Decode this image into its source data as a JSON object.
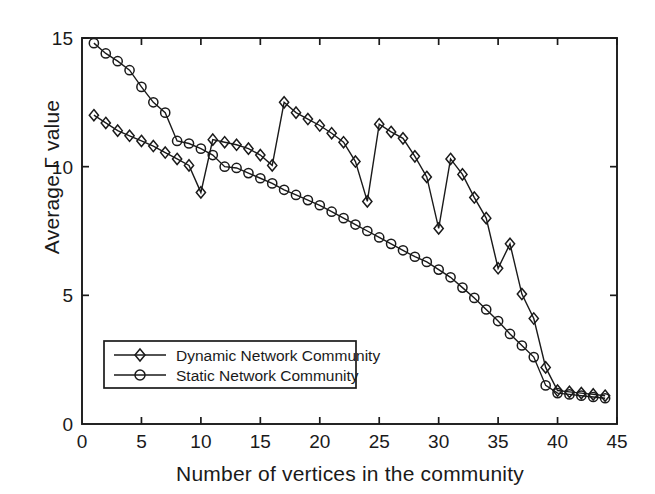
{
  "chart_data": {
    "type": "line",
    "title": "",
    "xlabel": "Number of vertices in the community",
    "ylabel": "Average Γ value",
    "xlim": [
      0,
      45
    ],
    "ylim": [
      0,
      15
    ],
    "xticks": [
      0,
      5,
      10,
      15,
      20,
      25,
      30,
      35,
      40,
      45
    ],
    "yticks": [
      0,
      5,
      10,
      15
    ],
    "xticklabels": [
      "0",
      "5",
      "10",
      "15",
      "20",
      "25",
      "30",
      "35",
      "40",
      "45"
    ],
    "yticklabels": [
      "0",
      "5",
      "10",
      "15"
    ],
    "grid": false,
    "legend_position": "lower left",
    "x": [
      1,
      2,
      3,
      4,
      5,
      6,
      7,
      8,
      9,
      10,
      11,
      12,
      13,
      14,
      15,
      16,
      17,
      18,
      19,
      20,
      21,
      22,
      23,
      24,
      25,
      26,
      27,
      28,
      29,
      30,
      31,
      32,
      33,
      34,
      35,
      36,
      37,
      38,
      39,
      40,
      41,
      42,
      43,
      44
    ],
    "series": [
      {
        "name": "Dynamic Network Community",
        "marker": "diamond",
        "color": "#1a1a1a",
        "values": [
          12.0,
          11.7,
          11.4,
          11.2,
          11.0,
          10.8,
          10.55,
          10.3,
          10.05,
          9.0,
          11.05,
          10.95,
          10.85,
          10.7,
          10.45,
          10.05,
          12.5,
          12.1,
          11.85,
          11.6,
          11.3,
          10.95,
          10.2,
          8.65,
          11.65,
          11.35,
          11.1,
          10.4,
          9.6,
          7.6,
          10.3,
          9.7,
          8.8,
          8.0,
          6.05,
          7.0,
          5.05,
          4.1,
          2.2,
          1.3,
          1.25,
          1.2,
          1.15,
          1.1
        ]
      },
      {
        "name": "Static Network Community",
        "marker": "circle",
        "color": "#1a1a1a",
        "values": [
          14.8,
          14.4,
          14.1,
          13.75,
          13.1,
          12.5,
          12.1,
          11.0,
          10.9,
          10.7,
          10.45,
          10.0,
          9.95,
          9.75,
          9.55,
          9.35,
          9.1,
          8.9,
          8.7,
          8.5,
          8.25,
          8.0,
          7.75,
          7.5,
          7.25,
          7.0,
          6.75,
          6.5,
          6.3,
          6.0,
          5.7,
          5.3,
          4.9,
          4.45,
          4.0,
          3.5,
          3.05,
          2.6,
          1.5,
          1.2,
          1.15,
          1.1,
          1.05,
          1.0
        ]
      }
    ]
  },
  "legend": {
    "items": [
      {
        "label": "Dynamic Network Community",
        "marker": "diamond"
      },
      {
        "label": "Static Network Community",
        "marker": "circle"
      }
    ]
  }
}
